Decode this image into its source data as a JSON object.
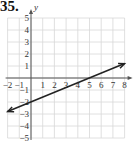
{
  "problem": {
    "number": "35."
  },
  "chart_data": {
    "type": "line",
    "title": "",
    "xlabel": "x",
    "ylabel": "y",
    "xlim": [
      -2,
      8
    ],
    "ylim": [
      -5,
      5
    ],
    "grid": true,
    "x_ticks": [
      "-2",
      "-1",
      "1",
      "2",
      "3",
      "4",
      "5",
      "6",
      "7",
      "8"
    ],
    "y_ticks": [
      "5",
      "4",
      "3",
      "2",
      "1",
      "-1",
      "-2",
      "-3",
      "-4",
      "-5"
    ],
    "series": [
      {
        "name": "line",
        "equation": "y = (2/5)x - 2",
        "x": [
          -2,
          0,
          5,
          8
        ],
        "y": [
          -2.8,
          -2,
          0,
          1.2
        ],
        "arrows": "both",
        "color": "#222222"
      }
    ]
  }
}
